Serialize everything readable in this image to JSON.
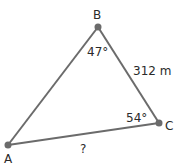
{
  "diagram": {
    "type": "triangle",
    "vertices": [
      {
        "label": "A",
        "x": 8,
        "y": 145
      },
      {
        "label": "B",
        "x": 98,
        "y": 27
      },
      {
        "label": "C",
        "x": 159,
        "y": 123
      }
    ],
    "angles": {
      "B": "47°",
      "C": "54°"
    },
    "sides": {
      "BC": "312 m",
      "AC": "?"
    },
    "colors": {
      "line": "#6b6b6b",
      "vertex": "#6b6b6b",
      "text": "#2a2a2a"
    }
  }
}
